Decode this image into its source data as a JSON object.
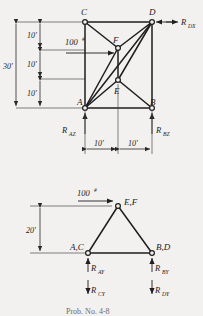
{
  "figure": {
    "title_caption": "Prob. No. 4-8",
    "units_note": "#"
  },
  "upper_diagram": {
    "name": "space-frame-elevation-view",
    "nodes": [
      {
        "id": "C",
        "label": "C",
        "x": 85,
        "y": 22
      },
      {
        "id": "D",
        "label": "D",
        "x": 152,
        "y": 22
      },
      {
        "id": "F",
        "label": "F",
        "x": 118,
        "y": 48
      },
      {
        "id": "E",
        "label": "E",
        "x": 118,
        "y": 80
      },
      {
        "id": "A",
        "label": "A",
        "x": 85,
        "y": 108
      },
      {
        "id": "B",
        "label": "B",
        "x": 152,
        "y": 108
      }
    ],
    "members": [
      {
        "from": "C",
        "to": "D"
      },
      {
        "from": "C",
        "to": "A"
      },
      {
        "from": "D",
        "to": "B"
      },
      {
        "from": "A",
        "to": "B"
      },
      {
        "from": "C",
        "to": "F"
      },
      {
        "from": "D",
        "to": "F"
      },
      {
        "from": "F",
        "to": "E"
      },
      {
        "from": "F",
        "to": "A"
      },
      {
        "from": "D",
        "to": "E"
      },
      {
        "from": "E",
        "to": "A"
      },
      {
        "from": "E",
        "to": "B"
      },
      {
        "from": "A",
        "to": "D"
      }
    ],
    "vertical_dimensions": {
      "overall_label": "30'",
      "segment_labels": [
        "10'",
        "10'",
        "10'"
      ]
    },
    "horizontal_dimensions": {
      "segment_labels": [
        "10'",
        "10'"
      ]
    },
    "applied_load": {
      "magnitude": "100",
      "unit_symbol": "#",
      "direction": "right",
      "at_node": "F"
    },
    "reactions": [
      {
        "base": "R",
        "sub": "DX",
        "at_node": "D",
        "direction": "left"
      },
      {
        "base": "R",
        "sub": "AZ",
        "at_node": "A",
        "direction": "up"
      },
      {
        "base": "R",
        "sub": "BZ",
        "at_node": "B",
        "direction": "up"
      }
    ]
  },
  "lower_diagram": {
    "name": "space-frame-end-view",
    "nodes": [
      {
        "id": "EF",
        "label": "E,F",
        "x": 118,
        "y": 206
      },
      {
        "id": "AC",
        "label": "A,C",
        "x": 88,
        "y": 253
      },
      {
        "id": "BD",
        "label": "B,D",
        "x": 152,
        "y": 253
      }
    ],
    "members": [
      {
        "from": "EF",
        "to": "AC"
      },
      {
        "from": "EF",
        "to": "BD"
      },
      {
        "from": "AC",
        "to": "BD"
      }
    ],
    "vertical_dimension": {
      "label": "20'"
    },
    "applied_load": {
      "magnitude": "100",
      "unit_symbol": "#",
      "direction": "right",
      "at_node": "E,F"
    },
    "reactions": [
      {
        "base": "R",
        "sub": "AY",
        "at_node": "A,C",
        "direction": "up"
      },
      {
        "base": "R",
        "sub": "CY",
        "at_node": "A,C",
        "direction": "down"
      },
      {
        "base": "R",
        "sub": "BY",
        "at_node": "B,D",
        "direction": "up"
      },
      {
        "base": "R",
        "sub": "DY",
        "at_node": "B,D",
        "direction": "down"
      }
    ]
  },
  "colors": {
    "background": "#f2f1ef",
    "ink": "#1e1e1e",
    "dimension_ink": "#4a4a4a"
  }
}
